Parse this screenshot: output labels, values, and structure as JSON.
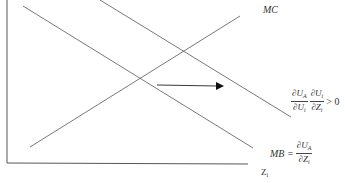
{
  "diagram": {
    "type": "supply-demand-shift",
    "axes": {
      "x_label": "Z",
      "x_label_sub": "i",
      "y_label": ""
    },
    "curves": [
      {
        "id": "mc",
        "label": "MC",
        "direction": "upward"
      },
      {
        "id": "mb",
        "label_lhs": "MB =",
        "label_num": "∂U",
        "label_num_sub": "A",
        "label_den": "∂Z",
        "label_den_sub": "i",
        "direction": "downward"
      },
      {
        "id": "shifted",
        "term1_num": "∂U",
        "term1_num_sub": "A",
        "term1_den": "∂U",
        "term1_den_sub": "i",
        "term2_num": "∂U",
        "term2_num_sub": "i",
        "term2_den": "∂Z",
        "term2_den_sub": "i",
        "rhs": "> 0",
        "direction": "downward"
      }
    ],
    "arrow": {
      "meaning": "rightward shift of marginal benefit curve"
    },
    "colors": {
      "line": "#555555",
      "axis": "#444444",
      "arrow": "#111111"
    }
  }
}
